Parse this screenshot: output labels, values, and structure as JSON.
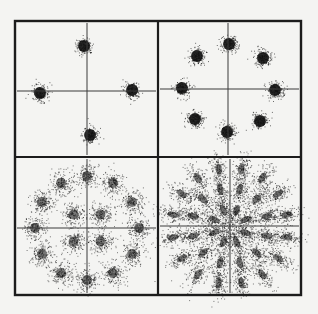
{
  "figure": {
    "background": "#f4f4f2",
    "frame": {
      "x": 15,
      "y": 21,
      "width": 286,
      "height": 274
    },
    "divider": {
      "x": 158,
      "y": 157
    },
    "ink_color": "#111111"
  },
  "panels": [
    {
      "id": "qpsk",
      "label": "4-point constellation (QPSK)",
      "center": [
        87,
        91
      ],
      "axes": {
        "x_from": 17,
        "x_to": 156,
        "y_from": 23,
        "y_to": 155
      },
      "blob_radius": 7,
      "blob_spread": 4.2,
      "points": [
        [
          84,
          46
        ],
        [
          40,
          93
        ],
        [
          132,
          90
        ],
        [
          90,
          135
        ]
      ]
    },
    {
      "id": "8psk",
      "label": "8-point constellation (8PSK)",
      "center": [
        228,
        89
      ],
      "axes": {
        "x_from": 160,
        "x_to": 299,
        "y_from": 23,
        "y_to": 155
      },
      "blob_radius": 7,
      "blob_spread": 4.2,
      "points": [
        [
          229,
          44
        ],
        [
          197,
          56
        ],
        [
          263,
          58
        ],
        [
          182,
          88
        ],
        [
          275,
          90
        ],
        [
          195,
          119
        ],
        [
          260,
          121
        ],
        [
          227,
          132
        ]
      ]
    },
    {
      "id": "16apsk",
      "label": "16-point constellation (4+12 APSK)",
      "center": [
        87,
        228
      ],
      "axes": {
        "x_from": 17,
        "x_to": 156,
        "y_from": 159,
        "y_to": 293
      },
      "blob_radius": 9,
      "blob_spread": 6,
      "rings": [
        {
          "count": 4,
          "radius": 19,
          "phase_deg": 45
        },
        {
          "count": 12,
          "radius": 52,
          "phase_deg": 0
        }
      ]
    },
    {
      "id": "32apsk",
      "label": "32-point constellation (radial sunburst)",
      "center": [
        230,
        226
      ],
      "axes": {
        "x_from": 160,
        "x_to": 299,
        "y_from": 159,
        "y_to": 293
      },
      "blob_radius": 8,
      "blob_spread": 5.5,
      "elongated": true,
      "rings": [
        {
          "count": 8,
          "radius": 17,
          "phase_deg": 22.5
        },
        {
          "count": 12,
          "radius": 38,
          "phase_deg": 15
        },
        {
          "count": 16,
          "radius": 58,
          "phase_deg": 11.25
        }
      ]
    }
  ]
}
